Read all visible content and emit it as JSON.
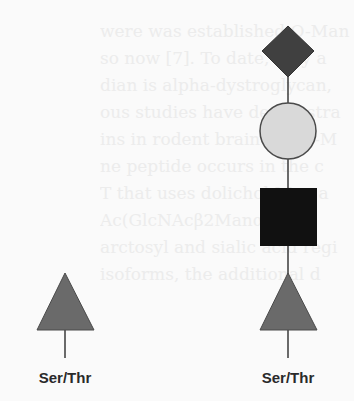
{
  "background_text": {
    "lines": [
      "were was established O-Man",
      "so now [7]. To date, only a",
      "dian is alpha-dystroglycan,",
      "ous studies have demonstra",
      "ins in rodent brain are O-M",
      "ne peptide occurs in the c",
      "T that uses dolichol-Man a",
      "Ac(GlcNAcβ2Manα1-O-S",
      "arctosyl and sialic acid regi",
      "isoforms, the additional d"
    ]
  },
  "glycans": [
    {
      "id": "left",
      "label": "Ser/Thr",
      "residues": [
        {
          "shape": "triangle",
          "color": "#6a6a6a"
        }
      ]
    },
    {
      "id": "right",
      "label": "Ser/Thr",
      "residues": [
        {
          "shape": "diamond",
          "color": "#404040"
        },
        {
          "shape": "circle",
          "color": "#d9d9d9"
        },
        {
          "shape": "square",
          "color": "#111111"
        },
        {
          "shape": "triangle",
          "color": "#6a6a6a"
        }
      ]
    }
  ],
  "colors": {
    "line": "#3a3a3a",
    "stroke": "#4a4a4a"
  }
}
